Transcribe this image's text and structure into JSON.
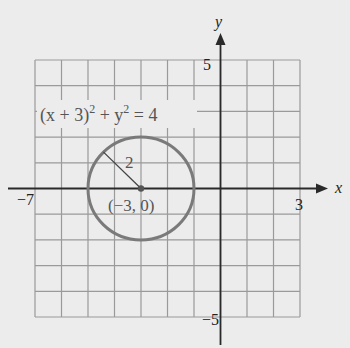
{
  "chart_data": {
    "type": "line",
    "title": "",
    "equation": "(x + 3)^2 + y^2 = 4",
    "equation_parts": {
      "lhs_a": "(x + 3)",
      "exp1": "2",
      "plus": " + y",
      "exp2": "2",
      "rhs": " = 4"
    },
    "xlabel": "x",
    "ylabel": "y",
    "xlim": [
      -7,
      3
    ],
    "ylim": [
      -5,
      5
    ],
    "grid": true,
    "grid_step": 1,
    "tick_labels": {
      "x_min": "−7",
      "x_max": "3",
      "y_max": "5",
      "y_min": "−5"
    },
    "series": [
      {
        "name": "circle",
        "shape": "circle",
        "center": [
          -3,
          0
        ],
        "radius": 2,
        "color": "#7a7a7a"
      }
    ],
    "annotations": [
      {
        "text": "2",
        "meaning": "radius",
        "at": [
          -3.8,
          1.1
        ]
      },
      {
        "text": "(−3, 0)",
        "meaning": "center point",
        "at": [
          -3,
          -0.6
        ]
      }
    ]
  },
  "colors": {
    "background": "#ececec",
    "grid": "#9a9a9a",
    "axis": "#2a2a2a",
    "circle": "#7a7a7a",
    "text": "#555555"
  }
}
